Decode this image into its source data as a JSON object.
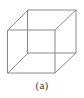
{
  "figure": {
    "type": "line-drawing",
    "caption": "(a)",
    "background_color": "#ffffff",
    "line_color": "#8a8a8a",
    "line_width": 1,
    "caption_color": "#3b3b3b",
    "geometry": {
      "front_face": {
        "label": "front-square",
        "top_left": [
          8,
          30
        ],
        "top_right": [
          55,
          30
        ],
        "bottom_right": [
          55,
          73
        ],
        "bottom_left": [
          8,
          73
        ]
      },
      "back_face": {
        "label": "back-square",
        "top_left": [
          28,
          10
        ],
        "top_right": [
          76,
          10
        ],
        "bottom_right": [
          76,
          53
        ],
        "bottom_left": [
          28,
          53
        ]
      },
      "connector_edges": [
        {
          "name": "top-left-connector",
          "from": [
            8,
            30
          ],
          "to": [
            28,
            10
          ]
        },
        {
          "name": "top-right-connector",
          "from": [
            55,
            30
          ],
          "to": [
            76,
            10
          ]
        },
        {
          "name": "bottom-right-connector",
          "from": [
            55,
            73
          ],
          "to": [
            76,
            53
          ]
        },
        {
          "name": "bottom-left-connector",
          "from": [
            8,
            73
          ],
          "to": [
            28,
            53
          ]
        }
      ]
    },
    "paths": {
      "front_square": "M8,30 L55,30 L55,73 L8,73 Z",
      "back_square": "M28,10 L76,10 L76,53 L28,53 Z",
      "connector_top_left": "M8,30 L28,10",
      "connector_top_right": "M55,30 L76,10",
      "connector_bottom_right": "M55,73 L76,53",
      "connector_bottom_left": "M8,73 L28,53"
    }
  }
}
